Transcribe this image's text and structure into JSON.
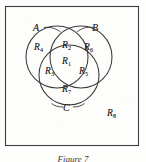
{
  "figure": {
    "kind": "venn-diagram-three-set",
    "caption": "Figure 7",
    "universe_border_color": "#3d3d3d",
    "circle_stroke_color": "#3a3a3a",
    "label_color": "#1c1c1c",
    "background_color": "#fdfdfb"
  },
  "sets": [
    {
      "id": "A",
      "label": "A",
      "leader": "right"
    },
    {
      "id": "B",
      "label": "B",
      "leader": "left"
    },
    {
      "id": "C",
      "label": "C",
      "leader": "both"
    }
  ],
  "regions": [
    {
      "id": "R1",
      "base": "R",
      "sub": "1",
      "meaning": "A and B and C",
      "x": 68,
      "y": 62
    },
    {
      "id": "R2",
      "base": "R",
      "sub": "2",
      "meaning": "A and B, not C",
      "x": 68,
      "y": 46
    },
    {
      "id": "R3",
      "base": "R",
      "sub": "3",
      "meaning": "A and C, not B",
      "x": 51,
      "y": 72
    },
    {
      "id": "R4",
      "base": "R",
      "sub": "4",
      "meaning": "A only",
      "x": 40,
      "y": 48
    },
    {
      "id": "R5",
      "base": "R",
      "sub": "5",
      "meaning": "B and C, not A",
      "x": 85,
      "y": 72
    },
    {
      "id": "R6",
      "base": "R",
      "sub": "6",
      "meaning": "B only",
      "x": 90,
      "y": 48
    },
    {
      "id": "R7",
      "base": "R",
      "sub": "7",
      "meaning": "C only",
      "x": 68,
      "y": 90
    },
    {
      "id": "R8",
      "base": "R",
      "sub": "8",
      "meaning": "outside all sets",
      "x": 113,
      "y": 114
    }
  ],
  "set_labels": [
    {
      "id": "A",
      "text": "A",
      "x": 37,
      "y": 28
    },
    {
      "id": "B",
      "text": "B",
      "x": 95,
      "y": 28
    },
    {
      "id": "C",
      "text": "C",
      "x": 66,
      "y": 108
    }
  ]
}
